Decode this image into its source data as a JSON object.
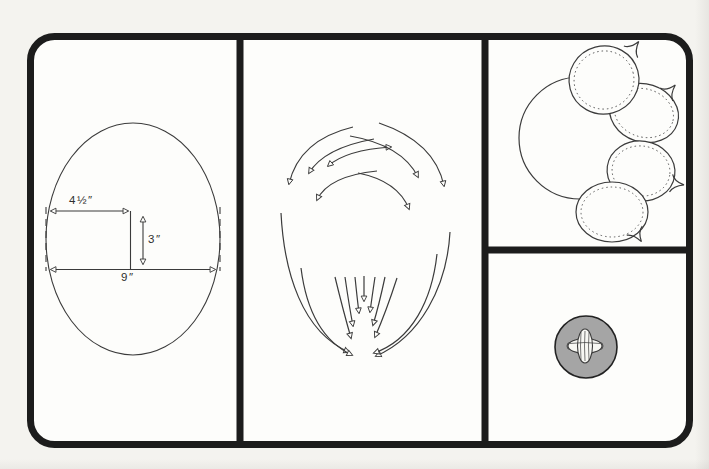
{
  "colors": {
    "paper": "#f4f3ef",
    "panel_bg": "#fdfdfb",
    "frame": "#1c1c1c",
    "line": "#3b3b3b",
    "button_gray": "#a5a5a5",
    "thread_white": "#f7f7f3"
  },
  "oval_panel": {
    "width_top_label": "4½″",
    "height_label": "3″",
    "width_bottom_label": "9″"
  },
  "illustrations": {
    "panel_1": "oval-with-dimensions",
    "panel_2": "stroke-direction-arrows",
    "panel_3": "balloon-cluster",
    "panel_4": "sewn-button"
  }
}
